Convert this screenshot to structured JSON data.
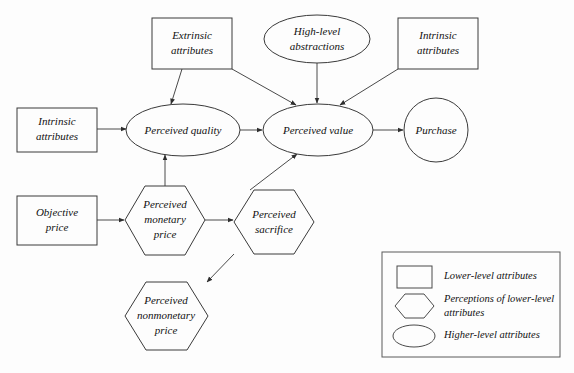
{
  "diagram": {
    "background_color": "#fdfdfd",
    "line_color": "#4a4a4a",
    "text_color": "#111111",
    "width": 574,
    "height": 373
  },
  "nodes": {
    "extrinsic_attributes": {
      "label_line1": "Extrinsic",
      "label_line2": "attributes",
      "shape": "rectangle",
      "category": "Lower-level attributes"
    },
    "high_level_abstractions": {
      "label_line1": "High-level",
      "label_line2": "abstractions",
      "shape": "ellipse",
      "category": "Higher-level attributes"
    },
    "intrinsic_attributes_top": {
      "label_line1": "Intrinsic",
      "label_line2": "attributes",
      "shape": "rectangle",
      "category": "Lower-level attributes"
    },
    "intrinsic_attributes_left": {
      "label_line1": "Intrinsic",
      "label_line2": "attributes",
      "shape": "rectangle",
      "category": "Lower-level attributes"
    },
    "perceived_quality": {
      "label_line1": "Perceived quality",
      "shape": "ellipse",
      "category": "Higher-level attributes"
    },
    "perceived_value": {
      "label_line1": "Perceived value",
      "shape": "ellipse",
      "category": "Higher-level attributes"
    },
    "purchase": {
      "label_line1": "Purchase",
      "shape": "circle",
      "category": "Higher-level attributes"
    },
    "objective_price": {
      "label_line1": "Objective",
      "label_line2": "price",
      "shape": "rectangle",
      "category": "Lower-level attributes"
    },
    "perceived_monetary_price": {
      "label_line1": "Perceived",
      "label_line2": "monetary",
      "label_line3": "price",
      "shape": "hexagon",
      "category": "Perceptions of lower-level attributes"
    },
    "perceived_sacrifice": {
      "label_line1": "Perceived",
      "label_line2": "sacrifice",
      "shape": "hexagon",
      "category": "Perceptions of lower-level attributes"
    },
    "perceived_nonmonetary_price": {
      "label_line1": "Perceived",
      "label_line2": "nonmonetary",
      "label_line3": "price",
      "shape": "hexagon",
      "category": "Perceptions of lower-level attributes"
    }
  },
  "edges": [
    {
      "from": "intrinsic_attributes_left",
      "to": "perceived_quality"
    },
    {
      "from": "extrinsic_attributes",
      "to": "perceived_quality"
    },
    {
      "from": "extrinsic_attributes",
      "to": "perceived_value"
    },
    {
      "from": "high_level_abstractions",
      "to": "perceived_value"
    },
    {
      "from": "intrinsic_attributes_top",
      "to": "perceived_value"
    },
    {
      "from": "perceived_quality",
      "to": "perceived_value"
    },
    {
      "from": "perceived_value",
      "to": "purchase"
    },
    {
      "from": "objective_price",
      "to": "perceived_monetary_price"
    },
    {
      "from": "perceived_monetary_price",
      "to": "perceived_quality"
    },
    {
      "from": "perceived_monetary_price",
      "to": "perceived_sacrifice"
    },
    {
      "from": "perceived_sacrifice",
      "to": "perceived_value"
    },
    {
      "from": "perceived_sacrifice",
      "to": "perceived_nonmonetary_price"
    }
  ],
  "legend": {
    "items": [
      {
        "shape": "rectangle",
        "label": "Lower-level attributes"
      },
      {
        "shape": "hexagon",
        "label_line1": "Perceptions of lower-level",
        "label_line2": "attributes"
      },
      {
        "shape": "ellipse",
        "label": "Higher-level attributes"
      }
    ]
  }
}
